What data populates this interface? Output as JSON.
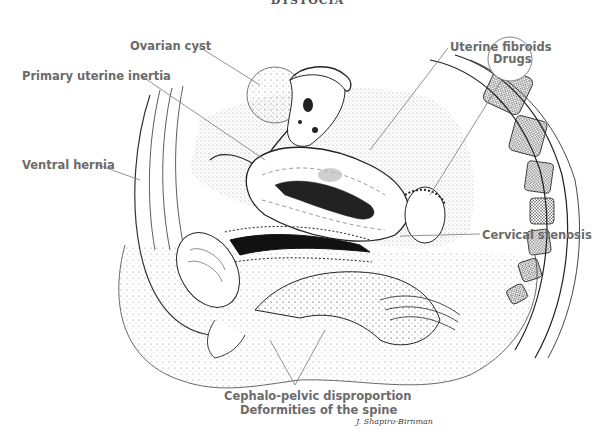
{
  "title": "DYSTOCIA",
  "labels": {
    "ovarian_cyst": "Ovarian cyst",
    "primary_uterine_inertia": "Primary uterine inertia",
    "ventral_hernia": "Ventral hernia",
    "uterine_fibroids": "Uterine fibroids",
    "drugs": "Drugs",
    "cervical_stenosis": "Cervical stenosis",
    "cephalo_pelvic": "Cephalo-pelvic disproportion",
    "spine_deformities": "Deformities of the spine"
  },
  "signature": "J. Shapiro-Birnman",
  "colors": {
    "label_text": "#6b6b6b",
    "line": "#777777",
    "ink": "#222222"
  }
}
